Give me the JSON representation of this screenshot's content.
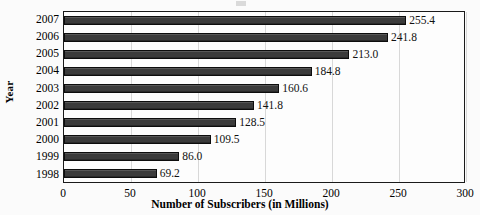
{
  "chart_data": {
    "type": "bar",
    "orientation": "horizontal",
    "title": "",
    "xlabel": "Number of Subscribers (in Millions)",
    "ylabel": "Year",
    "categories": [
      "2007",
      "2006",
      "2005",
      "2004",
      "2003",
      "2002",
      "2001",
      "2000",
      "1999",
      "1998"
    ],
    "values": [
      255.4,
      241.8,
      213.0,
      184.8,
      160.6,
      141.8,
      128.5,
      109.5,
      86.0,
      69.2
    ],
    "value_labels": [
      "255.4",
      "241.8",
      "213.0",
      "184.8",
      "160.6",
      "141.8",
      "128.5",
      "109.5",
      "86.0",
      "69.2"
    ],
    "xlim": [
      0,
      300
    ],
    "xticks": [
      0,
      50,
      100,
      150,
      200,
      250,
      300
    ],
    "xtick_labels": [
      "0",
      "50",
      "100",
      "150",
      "200",
      "250",
      "300"
    ],
    "grid": true,
    "grid_axis": "x",
    "legend": false,
    "bar_color": "#3b3b3b",
    "bar_border_color": "#0d0d0d",
    "plot_background": "#fdfdfd",
    "plot_border_color": "#1a1a1a",
    "gridline_color": "#d8d8d8",
    "page_background": "#fbfbfb",
    "text_color": "#000000"
  }
}
